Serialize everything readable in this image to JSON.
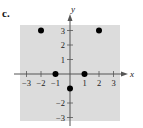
{
  "panel_label": "c.",
  "chart_data": {
    "type": "scatter",
    "title": "",
    "xlabel": "x",
    "ylabel": "y",
    "xlim": [
      -3,
      3
    ],
    "ylim": [
      -3,
      3
    ],
    "grid": false,
    "background": "#dcdcdc",
    "point_color": "#000000",
    "x_ticks": [
      -3,
      -2,
      -1,
      1,
      2,
      3
    ],
    "y_ticks": [
      3,
      2,
      1,
      -2,
      -3
    ],
    "x_tick_labels": [
      "−3",
      "−2",
      "−1",
      "1",
      "2",
      "3"
    ],
    "y_tick_labels": [
      "3",
      "2",
      "1",
      "−2",
      "−3"
    ],
    "points": [
      {
        "x": -2,
        "y": 3
      },
      {
        "x": 2,
        "y": 3
      },
      {
        "x": -1,
        "y": 0
      },
      {
        "x": 1,
        "y": 0
      },
      {
        "x": 0,
        "y": -1
      }
    ]
  }
}
